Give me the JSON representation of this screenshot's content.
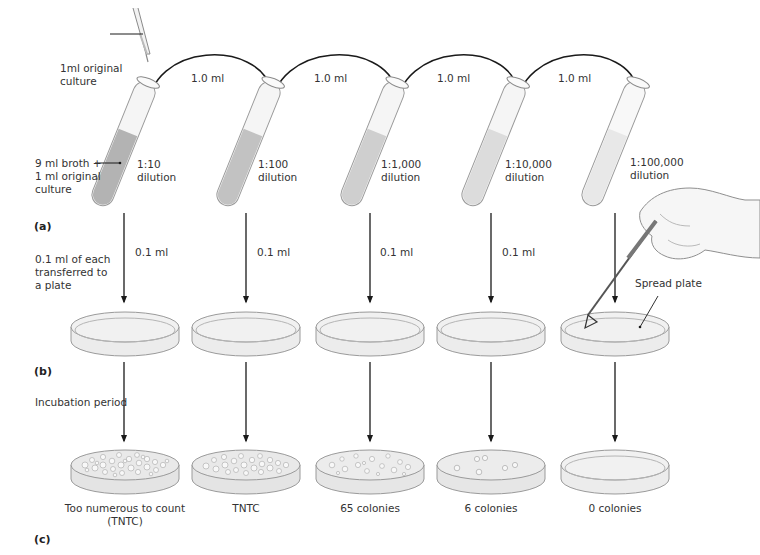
{
  "figure": {
    "panels": {
      "a": "(a)",
      "b": "(b)",
      "c": "(c)"
    },
    "colors": {
      "background": "#ffffff",
      "line": "#1a1a1a",
      "glass": "#f4f4f4",
      "glass_edge": "#9a9a9a",
      "liquid_shades": [
        "#b3b3b3",
        "#c2c2c2",
        "#cfcfcf",
        "#dcdcdc",
        "#e8e8e8"
      ],
      "plate_fill": "#ececec",
      "colony": "#f7f7f7"
    },
    "annotations": {
      "pipette_label": [
        "1ml original",
        "culture"
      ],
      "tube1_label": [
        "9 ml broth +",
        "1 ml original",
        "culture"
      ],
      "transfer_label": [
        "0.1 ml of each",
        "transferred to",
        "a plate"
      ],
      "incubation_label": "Incubation period",
      "spread_plate_label": "Spread plate"
    },
    "transfers": [
      "1.0 ml",
      "1.0 ml",
      "1.0 ml",
      "1.0 ml"
    ],
    "tubes": [
      {
        "ratio": "1:10",
        "word": "dilution",
        "plate_volume": "0.1 ml"
      },
      {
        "ratio": "1:100",
        "word": "dilution",
        "plate_volume": "0.1 ml"
      },
      {
        "ratio": "1:1,000",
        "word": "dilution",
        "plate_volume": "0.1 ml"
      },
      {
        "ratio": "1:10,000",
        "word": "dilution",
        "plate_volume": "0.1 ml"
      },
      {
        "ratio": "1:100,000",
        "word": "dilution",
        "plate_volume": ""
      }
    ],
    "results": [
      {
        "line1": "Too numerous to count",
        "line2": "(TNTC)",
        "colonies": "TNTC"
      },
      {
        "line1": "TNTC",
        "line2": "",
        "colonies": "TNTC"
      },
      {
        "line1": "65 colonies",
        "line2": "",
        "colonies": 65
      },
      {
        "line1": "6 colonies",
        "line2": "",
        "colonies": 6
      },
      {
        "line1": "0 colonies",
        "line2": "",
        "colonies": 0
      }
    ]
  }
}
